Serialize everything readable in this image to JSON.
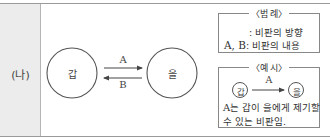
{
  "row_label": "(나)",
  "diagram": {
    "node_left": "갑",
    "node_right": "을",
    "arrow_top_label": "A",
    "arrow_bottom_label": "B"
  },
  "legend": {
    "title": "〈범 례〉",
    "arrow_meaning": ": 비판의 방향",
    "ab_symbols": "A, B",
    "ab_meaning": ": 비판의 내용"
  },
  "example": {
    "title": "〈예 시〉",
    "node_left": "갑",
    "node_right": "을",
    "arrow_label": "A",
    "line1_symbol": "A",
    "line1_text": "는 갑이 을에게 제기할",
    "line2_text": "수 있는 비판임."
  },
  "colors": {
    "line": "#555555",
    "label_bg": "#ececec",
    "border": "#9a9a9a"
  }
}
